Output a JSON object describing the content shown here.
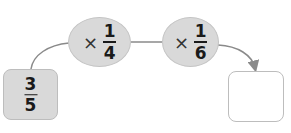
{
  "diagram": {
    "start": {
      "numerator": "3",
      "denominator": "5"
    },
    "operations": [
      {
        "operator": "×",
        "numerator": "1",
        "denominator": "4"
      },
      {
        "operator": "×",
        "numerator": "1",
        "denominator": "6"
      }
    ],
    "answer": {
      "value": ""
    }
  },
  "colors": {
    "node_fill": "#d9d9d9",
    "node_border": "#bdbdbd",
    "connector": "#8a8a8a",
    "text": "#1a1a1a"
  }
}
